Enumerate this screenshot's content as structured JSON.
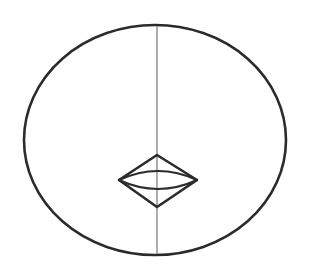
{
  "figure": {
    "canvas": {
      "width": 309,
      "height": 276,
      "background_color": "#ffffff"
    },
    "colors": {
      "outline_dark": "#2b2b2b",
      "divider_gray": "#808080",
      "background": "#ffffff"
    },
    "shapes": [
      {
        "name": "outer-ellipse",
        "type": "ellipse",
        "center_x": 155,
        "center_y": 140,
        "radius_x": 131,
        "radius_y": 115,
        "stroke_color": "#2b2b2b",
        "stroke_width": 2.6,
        "fill": "none"
      },
      {
        "name": "vertical-divider",
        "type": "line",
        "x1": 157,
        "y1": 26,
        "x2": 157,
        "y2": 254,
        "stroke_color": "#808080",
        "stroke_width": 1.3
      },
      {
        "name": "center-rhombus",
        "type": "polygon",
        "points": "119,180 157,155 197,180 157,207",
        "vertex_left_x": 119,
        "vertex_left_y": 180,
        "vertex_top_x": 157,
        "vertex_top_y": 155,
        "vertex_right_x": 197,
        "vertex_right_y": 180,
        "vertex_bottom_x": 157,
        "vertex_bottom_y": 207,
        "stroke_color": "#2b2b2b",
        "stroke_width": 2.6,
        "fill": "none"
      },
      {
        "name": "inner-lens-upper-arc",
        "type": "arc",
        "start_x": 119,
        "start_y": 180,
        "end_x": 197,
        "end_y": 180,
        "bulge_y": 171,
        "stroke_color": "#2b2b2b",
        "stroke_width": 2.2,
        "fill": "none"
      },
      {
        "name": "inner-lens-lower-arc",
        "type": "arc",
        "start_x": 119,
        "start_y": 180,
        "end_x": 197,
        "end_y": 180,
        "bulge_y": 189,
        "stroke_color": "#2b2b2b",
        "stroke_width": 2.2,
        "fill": "none"
      }
    ]
  }
}
